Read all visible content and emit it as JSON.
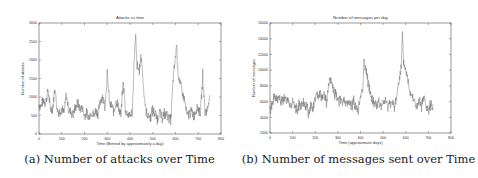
{
  "figure": {
    "captions": [
      "(a) Number of attacks over Time",
      "(b) Number of messages sent over Time"
    ]
  },
  "chart_data": [
    {
      "type": "line",
      "title": "Attacks vs time",
      "xlabel": "Time (Binned by approximately a day)",
      "ylabel": "Number of attacks",
      "xlim": [
        0,
        800
      ],
      "ylim": [
        0,
        3000
      ],
      "xticks": [
        0,
        100,
        200,
        300,
        400,
        500,
        600,
        700,
        800
      ],
      "yticks": [
        0,
        500,
        1000,
        1500,
        2000,
        2500,
        3000
      ],
      "grid": false,
      "legend": null,
      "series": [
        {
          "name": "attacks",
          "x": [
            0,
            10,
            20,
            30,
            40,
            50,
            60,
            70,
            80,
            90,
            100,
            110,
            120,
            130,
            140,
            150,
            160,
            170,
            180,
            190,
            200,
            210,
            220,
            230,
            240,
            250,
            260,
            270,
            280,
            290,
            300,
            310,
            320,
            330,
            340,
            350,
            360,
            370,
            380,
            390,
            400,
            410,
            420,
            425,
            430,
            440,
            450,
            460,
            470,
            480,
            490,
            500,
            510,
            520,
            530,
            540,
            550,
            560,
            570,
            580,
            590,
            600,
            605,
            610,
            620,
            630,
            640,
            650,
            660,
            670,
            680,
            690,
            700,
            710,
            720,
            730,
            740,
            750
          ],
          "values": [
            800,
            750,
            950,
            850,
            1200,
            650,
            700,
            1250,
            650,
            600,
            700,
            550,
            1050,
            650,
            600,
            550,
            700,
            850,
            650,
            700,
            500,
            550,
            450,
            600,
            500,
            650,
            550,
            900,
            1050,
            700,
            1650,
            800,
            750,
            600,
            900,
            700,
            500,
            1450,
            600,
            550,
            500,
            600,
            2200,
            2600,
            1900,
            1700,
            2100,
            1200,
            650,
            500,
            450,
            650,
            550,
            400,
            600,
            450,
            550,
            500,
            450,
            400,
            1500,
            2100,
            2450,
            1700,
            1400,
            1100,
            900,
            500,
            550,
            600,
            500,
            650,
            700,
            550,
            1600,
            600,
            650,
            1050
          ]
        }
      ],
      "annotations": [
        "Peak ~2600 near t≈425",
        "Second peak ~2450 near t≈605"
      ]
    },
    {
      "type": "line",
      "title": "Number of messages per day",
      "xlabel": "Time (approximate days)",
      "ylabel": "Number of messages",
      "xlim": [
        0,
        800
      ],
      "ylim": [
        2000,
        16000
      ],
      "xticks": [
        0,
        100,
        200,
        300,
        400,
        500,
        600,
        700,
        800
      ],
      "yticks": [
        2000,
        4000,
        6000,
        8000,
        10000,
        12000,
        14000,
        16000
      ],
      "grid": false,
      "legend": null,
      "series": [
        {
          "name": "messages",
          "x": [
            0,
            10,
            20,
            30,
            40,
            50,
            60,
            70,
            80,
            90,
            100,
            110,
            120,
            130,
            140,
            150,
            160,
            170,
            180,
            190,
            200,
            210,
            220,
            230,
            240,
            250,
            260,
            270,
            280,
            290,
            300,
            310,
            320,
            330,
            340,
            350,
            360,
            370,
            380,
            390,
            400,
            410,
            415,
            420,
            430,
            440,
            450,
            460,
            470,
            480,
            490,
            500,
            510,
            520,
            530,
            540,
            550,
            560,
            570,
            580,
            585,
            590,
            600,
            610,
            620,
            630,
            640,
            650,
            660,
            670,
            680,
            690,
            700,
            710,
            720
          ],
          "values": [
            4800,
            5800,
            6600,
            6200,
            6500,
            5900,
            6400,
            6000,
            6500,
            5500,
            5800,
            5200,
            5000,
            5600,
            5300,
            5700,
            5500,
            4500,
            5600,
            5000,
            6400,
            6800,
            7200,
            6600,
            7000,
            5800,
            8200,
            8800,
            7400,
            6800,
            6400,
            6000,
            5900,
            6300,
            5500,
            6000,
            5300,
            6200,
            5100,
            4800,
            6800,
            7800,
            11200,
            10600,
            9000,
            7600,
            6300,
            5800,
            5600,
            5900,
            5400,
            5800,
            6200,
            5300,
            6000,
            5700,
            5200,
            6800,
            8800,
            10200,
            14500,
            11000,
            10000,
            8600,
            7200,
            6800,
            5800,
            5200,
            6000,
            5500,
            6600,
            5200,
            4800,
            5500,
            5700
          ]
        }
      ],
      "annotations": [
        "Peak ~11200 near t≈415",
        "Peak ~14500 near t≈585"
      ]
    }
  ]
}
